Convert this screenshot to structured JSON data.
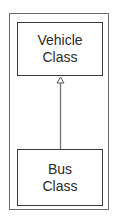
{
  "diagram": {
    "type": "uml-class-generalization",
    "classes": [
      {
        "id": "vehicle",
        "label_line1": "Vehicle",
        "label_line2": "Class"
      },
      {
        "id": "bus",
        "label_line1": "Bus",
        "label_line2": "Class"
      }
    ],
    "relationships": [
      {
        "from": "bus",
        "to": "vehicle",
        "kind": "inheritance",
        "arrowhead": "hollow-triangle"
      }
    ],
    "colors": {
      "border": "#3a3a3a",
      "frame": "#6a6a6a",
      "line": "#707070",
      "text": "#2a2a2a"
    }
  }
}
